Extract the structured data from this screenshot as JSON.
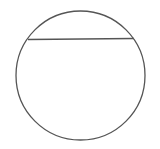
{
  "diagram": {
    "type": "circle-with-chord",
    "stroke_color": "#555555",
    "background": "#ffffff",
    "circle": {
      "cx": 80.5,
      "cy": 75.5,
      "r": 64.5
    },
    "chord": {
      "x1": 28,
      "y1": 39.5,
      "x2": 134,
      "y2": 38.5
    }
  }
}
